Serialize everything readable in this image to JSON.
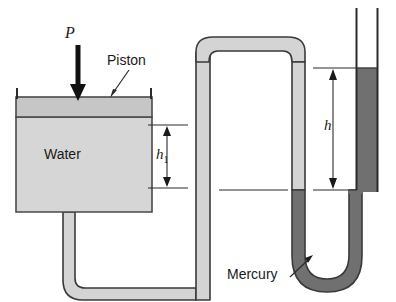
{
  "figure": {
    "type": "engineering-schematic",
    "width": 396,
    "height": 302,
    "background": "#ffffff"
  },
  "labels": {
    "pressure": "P",
    "piston": "Piston",
    "water": "Water",
    "mercury": "Mercury",
    "h1_base": "h",
    "h1_sub": "1",
    "h": "h"
  },
  "colors": {
    "outline": "#2b2b2b",
    "fluid_light": "#d0d0d0",
    "piston_fill": "#c4c4c4",
    "tube_wall": "#cfcfcf",
    "mercury_fill": "#6e6e6e",
    "arrow": "#111111",
    "text": "#1a1a1a",
    "background": "#ffffff"
  },
  "geometry": {
    "cylinder": {
      "x": 16,
      "y": 97,
      "width": 136,
      "height": 115
    },
    "piston_band": {
      "x": 16,
      "y": 97,
      "width": 136,
      "height": 20
    },
    "water_body": {
      "x": 16,
      "y": 117,
      "width": 136,
      "height": 95
    },
    "cylinder_walls_top_y": 88,
    "neck": {
      "x": 63,
      "y": 212,
      "width": 24,
      "height": 68
    },
    "right_tube": {
      "x_left": 356,
      "x_right": 377,
      "top_y": 8
    },
    "mercury_level_right_y": 68,
    "mercury_level_left_y": 190,
    "u_bend_bottom_y": 292,
    "inverted_u": {
      "x_left": 196,
      "x_right": 305,
      "top_y": 37,
      "wall": 13
    }
  },
  "dimensions": {
    "h1": {
      "label": "h₁",
      "top_y": 125,
      "bottom_y": 188,
      "tick_x_start": 148,
      "tick_x_end": 186
    },
    "h": {
      "label": "h",
      "top_y": 68,
      "bottom_y": 190,
      "tick_x_start": 313,
      "tick_x_end": 356
    }
  },
  "annotations": {
    "piston_leader": {
      "from_x": 129,
      "from_y": 70,
      "to_x": 110,
      "to_y": 97
    },
    "mercury_leader": {
      "from_x": 292,
      "from_y": 277,
      "to_x": 312,
      "to_y": 257
    },
    "pressure_arrow": {
      "x": 78,
      "from_y": 45,
      "to_y": 99
    }
  }
}
